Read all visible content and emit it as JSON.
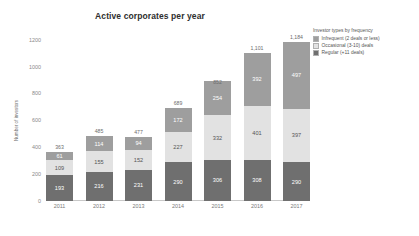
{
  "chart_data": {
    "type": "bar",
    "subtype": "stacked-bar",
    "title": "Active corporates per year",
    "xlabel": "",
    "ylabel": "Number of investors",
    "categories": [
      "2011",
      "2012",
      "2013",
      "2014",
      "2015",
      "2016",
      "2017"
    ],
    "ylim": [
      0,
      1250
    ],
    "yticks": [
      "0",
      "200",
      "400",
      "600",
      "800",
      "1000",
      "1200"
    ],
    "ytick_values": [
      0,
      200,
      400,
      600,
      800,
      1000,
      1200
    ],
    "grid": false,
    "legend_position": "top-right",
    "legend_title": "Investor types by frequency",
    "series": [
      {
        "name": "Regular (+11 deals)",
        "color": "#6f6f6f",
        "values": [
          193,
          216,
          231,
          290,
          306,
          308,
          290
        ]
      },
      {
        "name": "Occasional (3-10) deals",
        "color": "#e2e2e2",
        "values": [
          109,
          155,
          152,
          227,
          332,
          401,
          397
        ]
      },
      {
        "name": "Infrequent (2 deals or less)",
        "color": "#9e9e9e",
        "values": [
          61,
          114,
          94,
          172,
          254,
          392,
          497
        ]
      }
    ],
    "totals": [
      "363",
      "485",
      "477",
      "689",
      "852",
      "1,101",
      "1,184"
    ],
    "total_values": [
      363,
      485,
      477,
      689,
      852,
      1101,
      1184
    ],
    "segment_labels": [
      {
        "year": "2011",
        "regular": "193",
        "occasional": "109",
        "infrequent": "61"
      },
      {
        "year": "2012",
        "regular": "216",
        "occasional": "155",
        "infrequent": "114"
      },
      {
        "year": "2013",
        "regular": "231",
        "occasional": "152",
        "infrequent": "94"
      },
      {
        "year": "2014",
        "regular": "290",
        "occasional": "227",
        "infrequent": "172"
      },
      {
        "year": "2015",
        "regular": "306",
        "occasional": "332",
        "infrequent": "254"
      },
      {
        "year": "2016",
        "regular": "308",
        "occasional": "401",
        "infrequent": "392"
      },
      {
        "year": "2017",
        "regular": "290",
        "occasional": "397",
        "infrequent": "497"
      }
    ]
  }
}
